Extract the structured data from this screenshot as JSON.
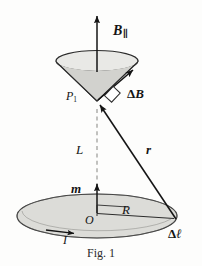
{
  "figure": {
    "caption": "Fig. 1",
    "labels": {
      "b_parallel": "B",
      "b_parallel_sub": "∥",
      "delta_b_delta": "Δ",
      "delta_b_sym": "B",
      "point_p1": "P",
      "point_p1_sub": "1",
      "r_vector": "r",
      "length_l": "L",
      "moment_m": "m",
      "origin_o": "O",
      "radius_r": "R",
      "delta_l_delta": "Δ",
      "delta_l_sym": "ℓ",
      "current_i": "I"
    },
    "colors": {
      "ink": "#141414",
      "paper": "#fdfdfc",
      "cone_fill": "#d6d6d2",
      "loop_fill": "#dcdcd8",
      "dashed_guide": "#9a9a96"
    },
    "geometry": {
      "p1": [
        97,
        101
      ],
      "origin_o": [
        97,
        213
      ],
      "delta_l": [
        176,
        219
      ],
      "cone_apex": [
        97,
        101
      ],
      "cone_top_center": [
        97,
        61
      ],
      "cone_top_rx": 41,
      "cone_top_ry": 10,
      "loop_center": [
        97,
        216
      ],
      "loop_rx": 80,
      "loop_ry": 22,
      "b_arrow_tip": [
        97,
        14
      ],
      "delta_b_tip": [
        135,
        72
      ]
    }
  }
}
